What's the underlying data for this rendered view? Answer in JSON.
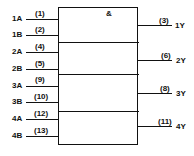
{
  "gate_symbol": "&",
  "inputs": [
    {
      "label": "1A",
      "pin": "(1)"
    },
    {
      "label": "1B",
      "pin": "(2)"
    },
    {
      "label": "2A",
      "pin": "(4)"
    },
    {
      "label": "2B",
      "pin": "(5)"
    },
    {
      "label": "3A",
      "pin": "(9)"
    },
    {
      "label": "3B",
      "pin": "(10)"
    },
    {
      "label": "4A",
      "pin": "(12)"
    },
    {
      "label": "4B",
      "pin": "(13)"
    }
  ],
  "outputs": [
    {
      "label": "1Y",
      "pin": "(3)"
    },
    {
      "label": "2Y",
      "pin": "(6)"
    },
    {
      "label": "3Y",
      "pin": "(8)"
    },
    {
      "label": "4Y",
      "pin": "(11)"
    }
  ]
}
